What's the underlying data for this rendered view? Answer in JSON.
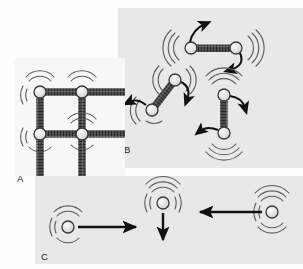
{
  "figure": {
    "title": "",
    "background_color": "#fefefe",
    "panel_fill_a": "#f7f7f7",
    "panel_fill_b": "#e8e8e8",
    "panel_fill_c": "#e8e8e8",
    "atom_fill": "#e3e3e3",
    "atom_stroke": "#3a3a3a",
    "bond_color": "#4a4a4a",
    "arrow_color": "#111111",
    "vibration_color": "#555555"
  },
  "panels": [
    {
      "id": "A",
      "label": "A",
      "caption": "",
      "kind": "crystal-lattice",
      "description": "Two-dimensional lattice of atoms joined by spring bonds, each atom shown vibrating in place",
      "rect": {
        "x": 14,
        "y": 58,
        "width": 111,
        "height": 118
      },
      "label_pos": {
        "x": 17,
        "y": 179
      },
      "atoms": [
        {
          "id": "a1",
          "cx": 40,
          "cy": 92,
          "r": 6,
          "vibrating": true
        },
        {
          "id": "a2",
          "cx": 82,
          "cy": 92,
          "r": 6,
          "vibrating": true
        },
        {
          "id": "a3",
          "cx": 40,
          "cy": 134,
          "r": 6,
          "vibrating": true
        },
        {
          "id": "a4",
          "cx": 82,
          "cy": 134,
          "r": 6,
          "vibrating": true
        }
      ],
      "bonds": [
        {
          "x1": 40,
          "y1": 92,
          "x2": 82,
          "y2": 92
        },
        {
          "x1": 82,
          "y1": 92,
          "x2": 124,
          "y2": 92
        },
        {
          "x1": 40,
          "y1": 134,
          "x2": 82,
          "y2": 134
        },
        {
          "x1": 82,
          "y1": 134,
          "x2": 124,
          "y2": 134
        },
        {
          "x1": 40,
          "y1": 92,
          "x2": 40,
          "y2": 134
        },
        {
          "x1": 82,
          "y1": 92,
          "x2": 82,
          "y2": 134
        },
        {
          "x1": 40,
          "y1": 134,
          "x2": 40,
          "y2": 176
        },
        {
          "x1": 82,
          "y1": 134,
          "x2": 82,
          "y2": 176
        }
      ]
    },
    {
      "id": "B",
      "label": "B",
      "caption": "",
      "kind": "rotating-molecules",
      "description": "Three diatomic molecules in different orientations, each rotating and vibrating",
      "rect": {
        "x": 118,
        "y": 8,
        "width": 185,
        "height": 160
      },
      "label_pos": {
        "x": 124,
        "y": 150
      },
      "molecules": [
        {
          "id": "m1",
          "orientation": "horizontal",
          "atom_a": {
            "cx": 191,
            "cy": 48,
            "r": 6,
            "vibrating": true
          },
          "atom_b": {
            "cx": 236,
            "cy": 48,
            "r": 6,
            "vibrating": true
          },
          "arrow_a": {
            "type": "curved",
            "direction": "up-right"
          },
          "arrow_b": {
            "type": "curved",
            "direction": "down-left"
          }
        },
        {
          "id": "m2",
          "orientation": "diagonal",
          "atom_a": {
            "cx": 175,
            "cy": 80,
            "r": 6,
            "vibrating": true
          },
          "atom_b": {
            "cx": 152,
            "cy": 110,
            "r": 6,
            "vibrating": true
          },
          "arrow_a": {
            "type": "curved",
            "direction": "down-right"
          },
          "arrow_b": {
            "type": "curved",
            "direction": "up-left"
          }
        },
        {
          "id": "m3",
          "orientation": "vertical",
          "atom_a": {
            "cx": 224,
            "cy": 95,
            "r": 6,
            "vibrating": true
          },
          "atom_b": {
            "cx": 224,
            "cy": 133,
            "r": 6,
            "vibrating": true
          },
          "arrow_a": {
            "type": "curved",
            "direction": "right-down"
          },
          "arrow_b": {
            "type": "curved",
            "direction": "left-up"
          }
        }
      ]
    },
    {
      "id": "C",
      "label": "C",
      "caption": "",
      "kind": "translating-atoms",
      "description": "Three single atoms translating in straight lines while vibrating",
      "rect": {
        "x": 35,
        "y": 176,
        "width": 268,
        "height": 88
      },
      "label_pos": {
        "x": 41,
        "y": 257
      },
      "atoms": [
        {
          "id": "c1",
          "cx": 68,
          "cy": 227,
          "r": 6,
          "vibrating": true,
          "arrow": {
            "type": "straight",
            "direction": "right",
            "x1": 78,
            "y1": 227,
            "x2": 140,
            "y2": 227
          }
        },
        {
          "id": "c2",
          "cx": 163,
          "cy": 203,
          "r": 6,
          "vibrating": true,
          "arrow": {
            "type": "straight",
            "direction": "down",
            "x1": 163,
            "y1": 213,
            "x2": 163,
            "y2": 243
          }
        },
        {
          "id": "c3",
          "cx": 272,
          "cy": 212,
          "r": 6,
          "vibrating": true,
          "arrow": {
            "type": "straight",
            "direction": "left",
            "x1": 262,
            "y1": 212,
            "x2": 196,
            "y2": 212
          }
        }
      ]
    }
  ],
  "icons": {
    "atom": "atom-circle-icon",
    "bond": "spring-bond-icon",
    "vibration": "vibration-lines-icon",
    "arrow_straight": "straight-arrow-icon",
    "arrow_curved": "curved-arrow-icon"
  }
}
